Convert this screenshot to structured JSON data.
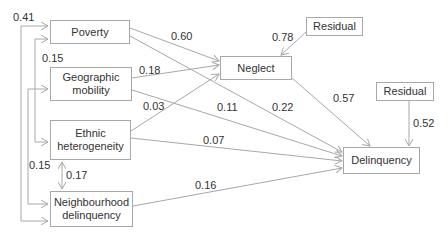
{
  "nodes": {
    "poverty": "Poverty",
    "geo_line1": "Geographic",
    "geo_line2": "mobility",
    "ethnic_line1": "Ethnic",
    "ethnic_line2": "heterogeneity",
    "neigh_line1": "Neighbourhood",
    "neigh_line2": "delinquency",
    "neglect": "Neglect",
    "delinquency": "Delinquency",
    "residual_neglect": "Residual",
    "residual_delinquency": "Residual"
  },
  "paths": {
    "poverty_neglect": "0.60",
    "poverty_delinquency": "0.22",
    "geo_neglect": "0.18",
    "geo_delinquency": "0.11",
    "ethnic_neglect": "0.03",
    "ethnic_delinquency": "0.07",
    "neigh_delinquency": "0.16",
    "neglect_delinquency": "0.57",
    "residual_neglect": "0.78",
    "residual_delinquency": "0.52"
  },
  "correlations": {
    "poverty_neigh": "0.41",
    "poverty_ethnic": "0.15",
    "geo_neigh": "0.15",
    "ethnic_neigh": "0.17"
  }
}
